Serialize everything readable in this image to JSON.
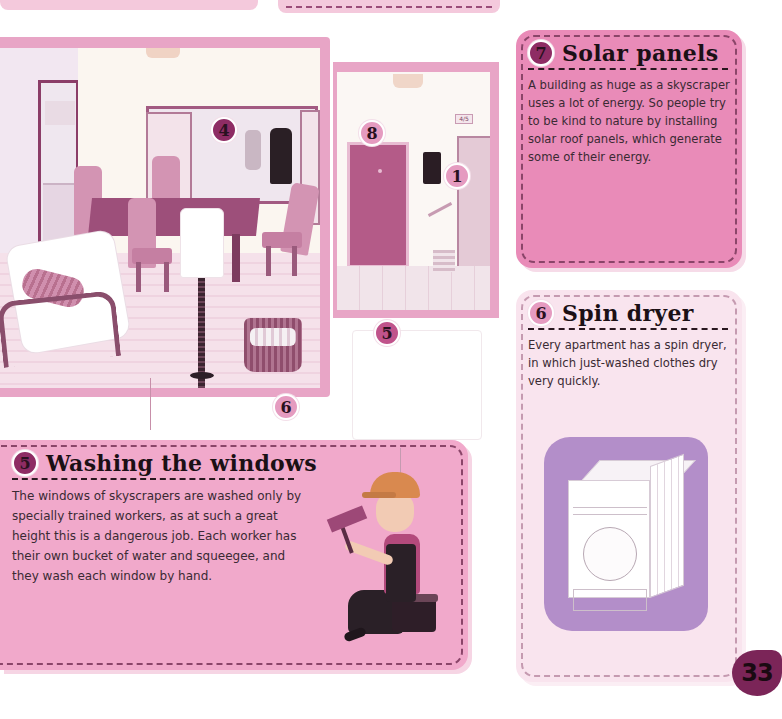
{
  "page": {
    "number": "33",
    "colors": {
      "panel_pink": "#e98bb8",
      "panel_light_pink": "#f9e4ee",
      "panel_wash_pink": "#f1a9cb",
      "frame_pink": "#e8a5c6",
      "badge_magenta": "#c0538b",
      "badge_dark": "#8e2c64",
      "dryer_lavender": "#b38ec9",
      "page_badge": "#7b2558"
    }
  },
  "illustration": {
    "callouts": [
      {
        "id": "callout-4",
        "number": "4",
        "target": "wardrobe"
      },
      {
        "id": "callout-6",
        "number": "6",
        "target": "laundry-basket"
      },
      {
        "id": "callout-8",
        "number": "8",
        "target": "apartment-door"
      },
      {
        "id": "callout-1",
        "number": "1",
        "target": "intercom"
      },
      {
        "id": "callout-5",
        "number": "5",
        "target": "window"
      }
    ],
    "elevator_sign": "4/5"
  },
  "panels": {
    "solar": {
      "number": "7",
      "title": "Solar panels",
      "body": "A building as huge as a skyscraper uses a lot of energy. So people try to be kind to nature by installing solar roof panels, which generate some of their energy."
    },
    "spin_dryer": {
      "number": "6",
      "title": "Spin dryer",
      "body": "Every apartment has a spin dryer, in which just-washed clothes dry very quickly."
    },
    "washing_windows": {
      "number": "5",
      "title": "Washing the windows",
      "body": "The windows of skyscrapers are washed only by specially trained workers, as at such a great height this is a dangerous job. Each worker has their own bucket of water and squeegee, and they wash each window by hand."
    }
  }
}
